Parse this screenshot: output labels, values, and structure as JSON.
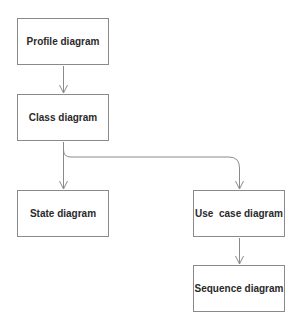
{
  "diagram": {
    "nodes": [
      {
        "id": "profile",
        "label": "Profile diagram"
      },
      {
        "id": "class",
        "label": "Class diagram"
      },
      {
        "id": "state",
        "label": "State diagram"
      },
      {
        "id": "usecase",
        "label": "Use  case diagram"
      },
      {
        "id": "sequence",
        "label": "Sequence diagram"
      }
    ],
    "edges": [
      {
        "from": "profile",
        "to": "class"
      },
      {
        "from": "class",
        "to": "state"
      },
      {
        "from": "class",
        "to": "usecase"
      },
      {
        "from": "usecase",
        "to": "sequence"
      }
    ]
  }
}
